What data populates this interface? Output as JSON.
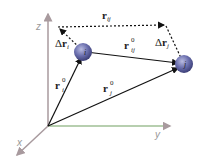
{
  "axes": {
    "x_label": "x",
    "y_label": "y",
    "z_label": "z",
    "colors": {
      "axis": "#a89a9e",
      "y_axis_tint": "#8fc98a"
    }
  },
  "atoms": {
    "i": {
      "label": "i",
      "color": "#6b6fae"
    },
    "j": {
      "label": "j",
      "color": "#6b6fae"
    }
  },
  "vectors": {
    "r_i0": {
      "base": "r",
      "sub": "i",
      "sup": "0"
    },
    "r_j0": {
      "base": "r",
      "sub": "j",
      "sup": "0"
    },
    "r_ij0": {
      "base": "r",
      "sub": "ij",
      "sup": "0"
    },
    "r_ij": {
      "base": "r",
      "sub": "ij"
    },
    "delta_r_i": {
      "prefix": "Δ",
      "base": "r",
      "sub": "i"
    },
    "delta_r_j": {
      "prefix": "Δ",
      "base": "r",
      "sub": "j"
    }
  }
}
